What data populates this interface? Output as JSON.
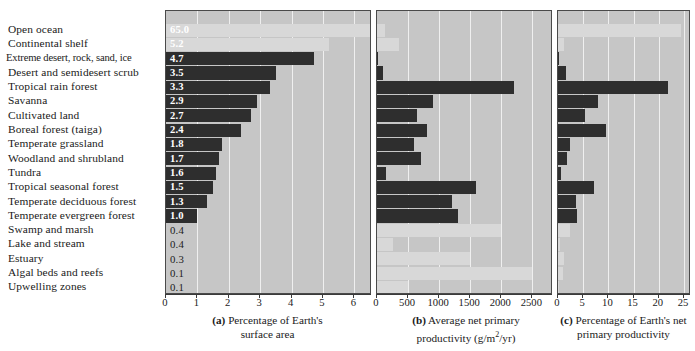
{
  "figure": {
    "biomes": [
      "Open ocean",
      "Continental shelf",
      "Extreme desert, rock, sand, ice",
      "Desert and semidesert scrub",
      "Tropical rain forest",
      "Savanna",
      "Cultivated land",
      "Boreal forest (taiga)",
      "Temperate grassland",
      "Woodland and shrubland",
      "Tundra",
      "Tropical seasonal forest",
      "Temperate deciduous forest",
      "Temperate evergreen forest",
      "Swamp and marsh",
      "Lake and stream",
      "Estuary",
      "Algal beds and reefs",
      "Upwelling zones"
    ],
    "captions": {
      "a": {
        "tag": "(a)",
        "line1": "Percentage of Earth's",
        "line2": "surface area"
      },
      "b": {
        "tag": "(b)",
        "line1": "Average net primary",
        "line2_pre": "productivity (g/m",
        "line2_sup": "2",
        "line2_post": "/yr)"
      },
      "c": {
        "tag": "(c)",
        "line1": "Percentage of Earth's net",
        "line2": "primary productivity"
      }
    },
    "colors": {
      "panel_background": "#c6c6c6",
      "gridline": "#efefef",
      "bar_dark": "#2e2e2e",
      "bar_light": "#d8d8d8",
      "axis": "#3a3a3a",
      "page_background": "#ffffff"
    }
  },
  "chart_data": [
    {
      "type": "bar",
      "id": "a",
      "orientation": "horizontal",
      "title": "(a) Percentage of Earth's surface area",
      "xlabel": "",
      "ylabel": "",
      "xlim": [
        0,
        6.5
      ],
      "xticks": [
        0,
        1,
        2,
        3,
        4,
        5,
        6
      ],
      "xticklabels": [
        "0",
        "1",
        "2",
        "3",
        "4",
        "5",
        "6"
      ],
      "grid": true,
      "categories": [
        "Open ocean",
        "Continental shelf",
        "Extreme desert, rock, sand, ice",
        "Desert and semidesert scrub",
        "Tropical rain forest",
        "Savanna",
        "Cultivated land",
        "Boreal forest (taiga)",
        "Temperate grassland",
        "Woodland and shrubland",
        "Tundra",
        "Tropical seasonal forest",
        "Temperate deciduous forest",
        "Temperate evergreen forest",
        "Swamp and marsh",
        "Lake and stream",
        "Estuary",
        "Algal beds and reefs",
        "Upwelling zones"
      ],
      "values": [
        65.0,
        5.2,
        4.7,
        3.5,
        3.3,
        2.9,
        2.7,
        2.4,
        1.8,
        1.7,
        1.6,
        1.5,
        1.3,
        1.0,
        0.4,
        0.4,
        0.3,
        0.1,
        0.1
      ],
      "datalabels": [
        "65.0",
        "5.2",
        "4.7",
        "3.5",
        "3.3",
        "2.9",
        "2.7",
        "2.4",
        "1.8",
        "1.7",
        "1.6",
        "1.5",
        "1.3",
        "1.0",
        "0.4",
        "0.4",
        "0.3",
        "0.1",
        "0.1"
      ],
      "bar_styles": [
        "light",
        "light",
        "dark",
        "dark",
        "dark",
        "dark",
        "dark",
        "dark",
        "dark",
        "dark",
        "dark",
        "dark",
        "dark",
        "dark",
        "none",
        "none",
        "none",
        "none",
        "none"
      ],
      "label_styles": [
        "onlight",
        "onlight",
        "white",
        "white",
        "white",
        "white",
        "white",
        "white",
        "white",
        "white",
        "white",
        "white",
        "white",
        "white",
        "dark",
        "dark",
        "dark",
        "dark",
        "dark"
      ],
      "note": "Open ocean bar is drawn clipped to the panel width; its true value 65.0 exceeds the 6.5 axis maximum."
    },
    {
      "type": "bar",
      "id": "b",
      "orientation": "horizontal",
      "title": "(b) Average net primary productivity (g/m2/yr)",
      "xlabel": "g/m2/yr",
      "ylabel": "",
      "xlim": [
        0,
        2800
      ],
      "xticks": [
        0,
        500,
        1000,
        1500,
        2000,
        2500
      ],
      "xticklabels": [
        "0",
        "500",
        "1000",
        "1500",
        "2000",
        "2500"
      ],
      "grid": true,
      "categories": [
        "Open ocean",
        "Continental shelf",
        "Extreme desert, rock, sand, ice",
        "Desert and semidesert scrub",
        "Tropical rain forest",
        "Savanna",
        "Cultivated land",
        "Boreal forest (taiga)",
        "Temperate grassland",
        "Woodland and shrubland",
        "Tundra",
        "Tropical seasonal forest",
        "Temperate deciduous forest",
        "Temperate evergreen forest",
        "Swamp and marsh",
        "Lake and stream",
        "Estuary",
        "Algal beds and reefs",
        "Upwelling zones"
      ],
      "values": [
        125,
        360,
        3,
        90,
        2200,
        900,
        650,
        800,
        600,
        700,
        140,
        1600,
        1200,
        1300,
        2000,
        250,
        1500,
        2500,
        500
      ],
      "bar_styles": [
        "light",
        "light",
        "dark",
        "dark",
        "dark",
        "dark",
        "dark",
        "dark",
        "dark",
        "dark",
        "dark",
        "dark",
        "dark",
        "dark",
        "light",
        "light",
        "light",
        "light",
        "light"
      ]
    },
    {
      "type": "bar",
      "id": "c",
      "orientation": "horizontal",
      "title": "(c) Percentage of Earth's net primary productivity",
      "xlabel": "",
      "ylabel": "",
      "xlim": [
        0,
        26
      ],
      "xticks": [
        0,
        5,
        10,
        15,
        20,
        25
      ],
      "xticklabels": [
        "0",
        "5",
        "10",
        "15",
        "20",
        "25"
      ],
      "grid": true,
      "categories": [
        "Open ocean",
        "Continental shelf",
        "Extreme desert, rock, sand, ice",
        "Desert and semidesert scrub",
        "Tropical rain forest",
        "Savanna",
        "Cultivated land",
        "Boreal forest (taiga)",
        "Temperate grassland",
        "Woodland and shrubland",
        "Tundra",
        "Tropical seasonal forest",
        "Temperate deciduous forest",
        "Temperate evergreen forest",
        "Swamp and marsh",
        "Lake and stream",
        "Estuary",
        "Algal beds and reefs",
        "Upwelling zones"
      ],
      "values": [
        24.4,
        1.2,
        0.04,
        1.5,
        21.9,
        7.9,
        5.4,
        9.6,
        2.4,
        1.8,
        0.6,
        7.1,
        3.5,
        3.8,
        2.3,
        0.3,
        1.1,
        0.9,
        0.1
      ],
      "bar_styles": [
        "light",
        "light",
        "dark",
        "dark",
        "dark",
        "dark",
        "dark",
        "dark",
        "dark",
        "dark",
        "dark",
        "dark",
        "dark",
        "dark",
        "light",
        "light",
        "light",
        "light",
        "light"
      ]
    }
  ]
}
